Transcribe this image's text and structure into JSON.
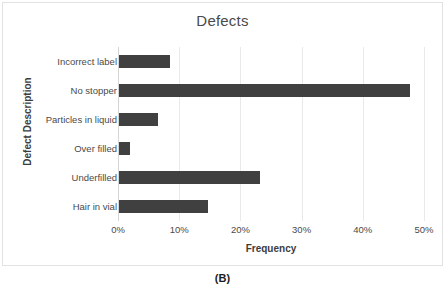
{
  "figure": {
    "caption": "(B)"
  },
  "chart_data": {
    "type": "bar",
    "orientation": "horizontal",
    "title": "Defects",
    "xlabel": "Frequency",
    "ylabel": "Defect Description",
    "categories": [
      "Incorrect label",
      "No stopper",
      "Particles in liquid",
      "Over filled",
      "Underfilled",
      "Hair in vial"
    ],
    "values": [
      8.3,
      47.5,
      6.3,
      1.8,
      23.0,
      14.6
    ],
    "value_labels": [
      "8.3%",
      "47.5%",
      "6.3%",
      "1.8%",
      "23.0%",
      "14.6%"
    ],
    "xlim": [
      0,
      50
    ],
    "xticks": [
      0,
      10,
      20,
      30,
      40,
      50
    ],
    "xtick_labels": [
      "0%",
      "10%",
      "20%",
      "30%",
      "40%",
      "50%"
    ],
    "grid": "vertical",
    "legend": "none",
    "bar_color": "#404040",
    "gridline_color": "#e9e9e9",
    "frame_border_color": "#e2e2e2",
    "text_color": "#4a4a4a"
  }
}
